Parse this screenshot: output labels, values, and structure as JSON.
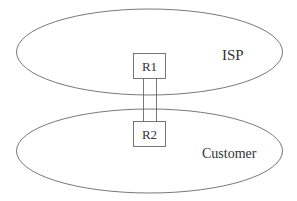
{
  "diagram": {
    "type": "network-topology",
    "colors": {
      "stroke": "#555555",
      "text": "#333333",
      "background": "#ffffff"
    },
    "regions": [
      {
        "id": "isp",
        "label": "ISP"
      },
      {
        "id": "customer",
        "label": "Customer"
      }
    ],
    "nodes": [
      {
        "id": "r1",
        "label": "R1",
        "region": "isp"
      },
      {
        "id": "r2",
        "label": "R2",
        "region": "customer"
      }
    ],
    "links": [
      {
        "from": "r1",
        "to": "r2",
        "style": "double-line"
      }
    ]
  }
}
